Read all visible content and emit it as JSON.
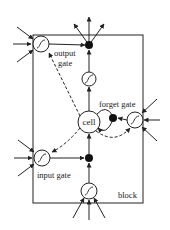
{
  "diagram": {
    "labels": {
      "output_gate_line1": "output",
      "output_gate_line2": "gate",
      "forget_gate": "forget gate",
      "cell": "cell",
      "input_gate": "input gate",
      "block": "block"
    },
    "colors": {
      "stroke": "#222222",
      "background": "#ffffff"
    }
  }
}
